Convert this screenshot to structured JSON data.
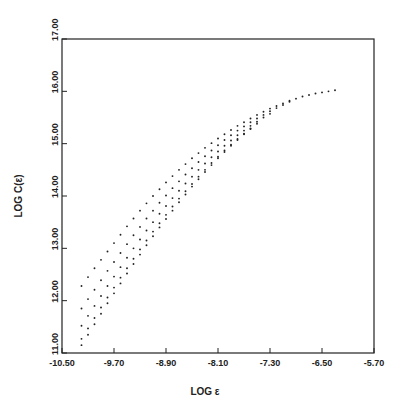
{
  "chart_data": {
    "type": "scatter",
    "title": "",
    "xlabel": "LOG ε",
    "ylabel": "LOG C(ε)",
    "xlim": [
      -10.5,
      -5.7
    ],
    "ylim": [
      11.0,
      17.0
    ],
    "x_ticks": [
      "-10.50",
      "-9.70",
      "-8.90",
      "-8.10",
      "-7.30",
      "-6.50",
      "-5.70"
    ],
    "x_tick_values": [
      -10.5,
      -9.7,
      -8.9,
      -8.1,
      -7.3,
      -6.5,
      -5.7
    ],
    "y_ticks": [
      "11.00",
      "12.00",
      "13.00",
      "14.00",
      "15.00",
      "16.00",
      "17.00"
    ],
    "y_tick_values": [
      11,
      12,
      13,
      14,
      15,
      16,
      17
    ],
    "grid": false,
    "legend": null,
    "series": [
      {
        "name": "curve-1",
        "x": [
          -10.2,
          -10.1,
          -10.0,
          -9.9,
          -9.8,
          -9.7,
          -9.6,
          -9.5,
          -9.4,
          -9.3,
          -9.2,
          -9.1,
          -9.0,
          -8.9,
          -8.8,
          -8.7,
          -8.6,
          -8.5,
          -8.4,
          -8.3,
          -8.2,
          -8.1,
          -8.0,
          -7.9,
          -7.8,
          -7.7,
          -7.6,
          -7.5,
          -7.4,
          -7.3,
          -7.2,
          -7.1,
          -7.0,
          -6.9,
          -6.8,
          -6.7,
          -6.6,
          -6.5,
          -6.4,
          -6.3
        ],
        "y": [
          12.28,
          12.45,
          12.62,
          12.78,
          12.94,
          13.1,
          13.26,
          13.42,
          13.57,
          13.72,
          13.86,
          14.0,
          14.13,
          14.26,
          14.38,
          14.5,
          14.61,
          14.72,
          14.82,
          14.92,
          15.01,
          15.1,
          15.18,
          15.26,
          15.34,
          15.41,
          15.48,
          15.55,
          15.61,
          15.67,
          15.72,
          15.77,
          15.82,
          15.86,
          15.9,
          15.93,
          15.96,
          15.98,
          16.0,
          16.02
        ]
      },
      {
        "name": "curve-2",
        "x": [
          -10.2,
          -10.1,
          -10.0,
          -9.9,
          -9.8,
          -9.7,
          -9.6,
          -9.5,
          -9.4,
          -9.3,
          -9.2,
          -9.1,
          -9.0,
          -8.9,
          -8.8,
          -8.7,
          -8.6,
          -8.5,
          -8.4,
          -8.3,
          -8.2,
          -8.1,
          -8.0,
          -7.9,
          -7.8,
          -7.7,
          -7.6,
          -7.5,
          -7.4,
          -7.3,
          -7.2,
          -7.1,
          -7.0
        ],
        "y": [
          11.85,
          12.03,
          12.21,
          12.39,
          12.57,
          12.74,
          12.91,
          13.08,
          13.25,
          13.41,
          13.57,
          13.72,
          13.87,
          14.01,
          14.15,
          14.28,
          14.41,
          14.53,
          14.65,
          14.76,
          14.87,
          14.97,
          15.07,
          15.16,
          15.25,
          15.33,
          15.41,
          15.48,
          15.55,
          15.62,
          15.68,
          15.74,
          15.8
        ]
      },
      {
        "name": "curve-3",
        "x": [
          -10.2,
          -10.1,
          -10.0,
          -9.9,
          -9.8,
          -9.7,
          -9.6,
          -9.5,
          -9.4,
          -9.3,
          -9.2,
          -9.1,
          -9.0,
          -8.9,
          -8.8,
          -8.7,
          -8.6,
          -8.5,
          -8.4,
          -8.3,
          -8.2,
          -8.1,
          -8.0,
          -7.9,
          -7.8,
          -7.7,
          -7.6,
          -7.5,
          -7.4,
          -7.3
        ],
        "y": [
          11.52,
          11.71,
          11.9,
          12.09,
          12.28,
          12.46,
          12.64,
          12.82,
          13.0,
          13.17,
          13.34,
          13.5,
          13.66,
          13.81,
          13.96,
          14.1,
          14.24,
          14.37,
          14.5,
          14.62,
          14.74,
          14.85,
          14.96,
          15.06,
          15.16,
          15.25,
          15.34,
          15.42,
          15.5,
          15.57
        ]
      },
      {
        "name": "curve-4",
        "x": [
          -10.2,
          -10.1,
          -10.0,
          -9.9,
          -9.8,
          -9.7,
          -9.6,
          -9.5,
          -9.4,
          -9.3,
          -9.2,
          -9.1,
          -9.0,
          -8.9,
          -8.8,
          -8.7,
          -8.6,
          -8.5,
          -8.4,
          -8.3,
          -8.2,
          -8.1,
          -8.0,
          -7.9,
          -7.8,
          -7.7,
          -7.6,
          -7.5
        ],
        "y": [
          11.27,
          11.47,
          11.67,
          11.87,
          12.06,
          12.25,
          12.44,
          12.62,
          12.8,
          12.98,
          13.15,
          13.32,
          13.48,
          13.64,
          13.8,
          13.95,
          14.09,
          14.23,
          14.37,
          14.5,
          14.63,
          14.75,
          14.87,
          14.98,
          15.09,
          15.19,
          15.29,
          15.38
        ]
      },
      {
        "name": "curve-5",
        "x": [
          -10.2,
          -10.1,
          -10.0,
          -9.9,
          -9.8,
          -9.7,
          -9.6,
          -9.5,
          -9.4,
          -9.3,
          -9.2,
          -9.1,
          -9.0,
          -8.9,
          -8.8,
          -8.7,
          -8.6,
          -8.5,
          -8.4,
          -8.3,
          -8.2,
          -8.1,
          -8.0,
          -7.9,
          -7.8,
          -7.7,
          -7.6
        ],
        "y": [
          11.15,
          11.35,
          11.55,
          11.75,
          11.95,
          12.14,
          12.33,
          12.52,
          12.7,
          12.88,
          13.06,
          13.23,
          13.4,
          13.56,
          13.72,
          13.88,
          14.03,
          14.18,
          14.32,
          14.46,
          14.59,
          14.72,
          14.84,
          14.96,
          15.07,
          15.18,
          15.28
        ]
      }
    ]
  }
}
